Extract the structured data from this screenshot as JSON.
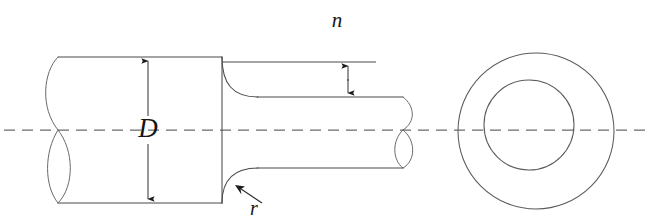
{
  "figure": {
    "kind": "engineering-drawing",
    "background_color": "#ffffff",
    "line_color": "#4a4a4a",
    "centerline_color": "#6b6b6b",
    "annotation_color": "#151515"
  },
  "labels": {
    "diameter": {
      "text": "D",
      "meaning": "large cylinder diameter",
      "x": 148,
      "y": 130
    },
    "step_height": {
      "text": "n",
      "meaning": "radial step height from large surface to small surface",
      "x": 337,
      "y": 22
    },
    "fillet_radius": {
      "text": "r",
      "meaning": "shoulder fillet radius",
      "x": 254,
      "y": 209
    }
  },
  "geometry": {
    "centerline": {
      "y": 130,
      "x_start": 4,
      "x_end": 651,
      "dash_pattern": "11 7"
    },
    "flange": {
      "name": "large-cylinder",
      "x_left": 58,
      "x_right": 222,
      "y_top": 57,
      "y_bottom": 203,
      "cap_bulge": 18
    },
    "shaft": {
      "name": "small-cylinder",
      "x_left": 222,
      "x_right": 402,
      "y_top": 97,
      "y_bottom": 168,
      "cap_bulge": 17
    },
    "fillet": {
      "radius": 34
    },
    "end_view": {
      "outer_circle": {
        "cx": 536,
        "cy": 131,
        "r": 78
      },
      "inner_circle": {
        "cx": 529,
        "cy": 125,
        "r": 45
      }
    }
  },
  "dimensions": {
    "D": {
      "orientation": "vertical",
      "x": 148,
      "y_top": 57,
      "y_bottom": 203,
      "gap_top": 116,
      "gap_bottom": 144,
      "arrow_at_top": true,
      "arrow_at_bottom": true
    },
    "n": {
      "orientation": "vertical",
      "x": 348,
      "y_top": 62,
      "y_bottom": 97,
      "arrow_at_top": true,
      "arrow_at_bottom": true,
      "extension_line": {
        "y": 62,
        "x_start": 223,
        "x_end": 376
      }
    },
    "r": {
      "orientation": "leader",
      "tip_x": 236,
      "tip_y": 186,
      "tail_x": 262,
      "tail_y": 203
    }
  }
}
